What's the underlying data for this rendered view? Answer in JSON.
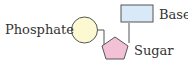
{
  "diagram": {
    "labels": {
      "phosphate": "Phosphate",
      "base": "Base",
      "sugar": "Sugar"
    },
    "colors": {
      "phosphate_fill": "#fbf8d2",
      "sugar_fill": "#f3c1d5",
      "base_fill": "#d9e9f7",
      "stroke": "#555555"
    }
  }
}
